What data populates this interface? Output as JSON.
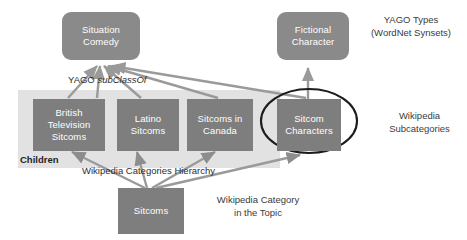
{
  "figure": {
    "nodes": {
      "situation_comedy": "Situation\nComedy",
      "fictional_character": "Fictional\nCharacter",
      "british_television_sitcoms": "British\nTelevision\nSitcoms",
      "latino_sitcoms": "Latino\nSitcoms",
      "sitcoms_in_canada": "Sitcoms in\nCanada",
      "sitcom_characters": "Sitcom\nCharacters",
      "sitcoms": "Sitcoms"
    },
    "captions": {
      "yago_types": "YAGO Types\n(WordNet Synsets)",
      "wikipedia_subcategories": "Wikipedia\nSubcategories",
      "wikipedia_category_in_topic": "Wikipedia Category\nin the Topic"
    },
    "edge_labels": {
      "yago_subclassof_prefix": "YAGO ",
      "yago_subclassof_italic": "subClassOf",
      "wikipedia_categories_hierarchy": "Wikipedia Categories Hierarchy"
    },
    "group_labels": {
      "children": "Children"
    },
    "colors": {
      "node_fill": "#7e7e7e",
      "rounded_node_fill": "#8a8a8a",
      "panel_fill": "#e2e2e2",
      "arrow_stroke": "#9a9a9a",
      "highlight_ellipse_stroke": "#1c1c1c",
      "text_light": "#ffffff",
      "text_dark": "#2e2e2e",
      "background": "#ffffff"
    }
  }
}
